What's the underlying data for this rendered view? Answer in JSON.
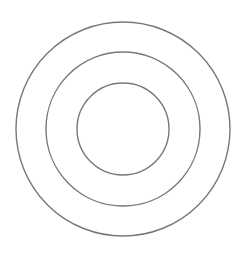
{
  "diagram": {
    "type": "concentric-circles",
    "background": "#ffffff",
    "stroke_color": "#777777",
    "stroke_width": 1.4,
    "center": {
      "x": 123,
      "y": 129
    },
    "circles": [
      {
        "name": "outer-circle",
        "r": 107
      },
      {
        "name": "middle-circle",
        "r": 77
      },
      {
        "name": "inner-circle",
        "r": 46
      }
    ]
  }
}
